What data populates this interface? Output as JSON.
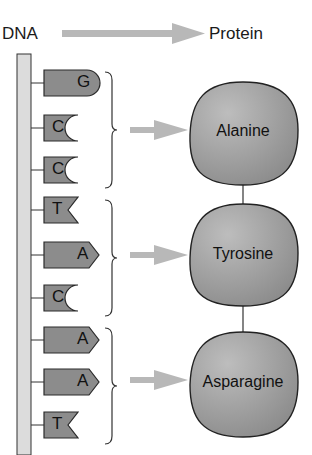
{
  "header": {
    "left_label": "DNA",
    "right_label": "Protein"
  },
  "colors": {
    "nucleotide_fill": "#8c8c8c",
    "amino_acid_fill": "#9a9a9a",
    "arrow": "#b5b5b5",
    "backbone": "#dcdcdc",
    "stroke": "#2a2a2a"
  },
  "nucleotides": [
    {
      "base": "G",
      "shape": "round"
    },
    {
      "base": "C",
      "shape": "concave"
    },
    {
      "base": "C",
      "shape": "concave"
    },
    {
      "base": "T",
      "shape": "notch"
    },
    {
      "base": "A",
      "shape": "point"
    },
    {
      "base": "C",
      "shape": "concave"
    },
    {
      "base": "A",
      "shape": "point"
    },
    {
      "base": "A",
      "shape": "point"
    },
    {
      "base": "T",
      "shape": "notch"
    }
  ],
  "amino_acids": [
    {
      "name": "Alanine",
      "codon": "GCC"
    },
    {
      "name": "Tyrosine",
      "codon": "TAC"
    },
    {
      "name": "Asparagine",
      "codon": "AAT"
    }
  ]
}
